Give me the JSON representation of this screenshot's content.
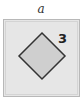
{
  "panel": {
    "label": "a",
    "shape": "diamond",
    "shape_label": "3",
    "colors": {
      "frame_fill": "#e6e6e6",
      "frame_border": "#b8b8b8",
      "diamond_fill": "#cfcfcf",
      "diamond_stroke": "#333333"
    }
  }
}
